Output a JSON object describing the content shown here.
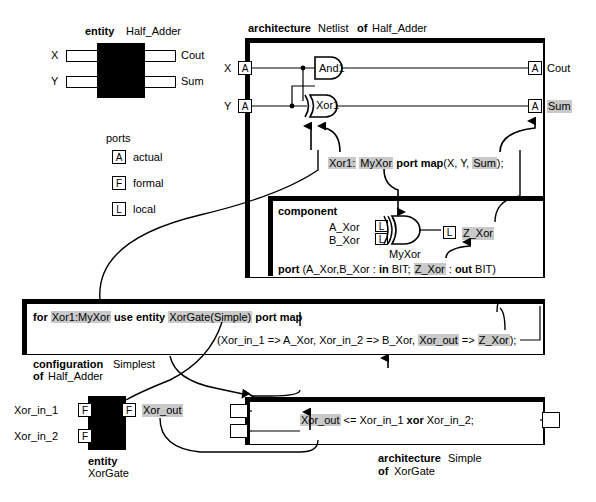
{
  "diagram": {
    "accent_highlight": "#c9c9c9"
  },
  "entity_half_adder": {
    "header_kw": "entity",
    "header_name": "Half_Adder",
    "left_ports": [
      "X",
      "Y"
    ],
    "right_ports": [
      "Cout",
      "Sum"
    ]
  },
  "ports_legend": {
    "title": "ports",
    "items": [
      {
        "tag": "A",
        "label": "actual"
      },
      {
        "tag": "F",
        "label": "formal"
      },
      {
        "tag": "L",
        "label": "local"
      }
    ]
  },
  "architecture_netlist": {
    "header_kw1": "architecture",
    "header_name": "Netlist",
    "header_kw2": "of",
    "header_of": "Half_Adder",
    "input_x_label": "X",
    "input_x_tag": "A",
    "input_y_label": "Y",
    "input_y_tag": "A",
    "gate_and_label": "And1",
    "gate_xor_label": "Xor1",
    "out_cout_tag": "A",
    "out_cout_label": "Cout",
    "out_sum_tag": "A",
    "out_sum_label": "Sum",
    "instantiation": {
      "inst_name": "Xor1:",
      "comp_name": "MyXor",
      "kw": "port map",
      "args_pre": "(X, Y, ",
      "arg_hl": "Sum",
      "args_post": ");"
    }
  },
  "component_box": {
    "header_kw": "component",
    "formal_a": "A_Xor",
    "formal_b": "B_Xor",
    "local_tag": "L",
    "gate_label": "MyXor",
    "out_tag": "L",
    "out_label": "Z_Xor",
    "port_decl": {
      "kw": "port",
      "pre": "(A_Xor,B_Xor : ",
      "in_kw": "in",
      "mid": " BIT; ",
      "hl": "Z_Xor",
      "mid2": " : ",
      "out_kw": "out",
      "post": " BIT)"
    }
  },
  "configuration_box": {
    "line1": {
      "for_kw": "for",
      "inst_hl": "Xor1:MyXor",
      "use_kw": "use entity",
      "entity_hl": "XorGate(Simple)",
      "map_kw": "port map"
    },
    "line2": {
      "pre": "(Xor_in_1 => A_Xor, Xor_in_2 => B_Xor, ",
      "hl1": "Xor_out",
      "mid": " => ",
      "hl2": "Z_Xor",
      "post": ");"
    },
    "caption_kw1": "configuration",
    "caption_name": "Simplest",
    "caption_kw2": "of",
    "caption_of": "Half_Adder"
  },
  "entity_xorgate": {
    "in1_label": "Xor_in_1",
    "in1_tag": "F",
    "in2_label": "Xor_in_2",
    "in2_tag": "F",
    "out_tag": "F",
    "out_label": "Xor_out",
    "caption_kw": "entity",
    "caption_name": "XorGate"
  },
  "architecture_simple": {
    "statement_hl": "Xor_out",
    "statement_pre": " <= Xor_in_1 ",
    "statement_kw": "xor",
    "statement_post": " Xor_in_2;",
    "caption_kw1": "architecture",
    "caption_name": "Simple",
    "caption_kw2": "of",
    "caption_of": "XorGate"
  }
}
